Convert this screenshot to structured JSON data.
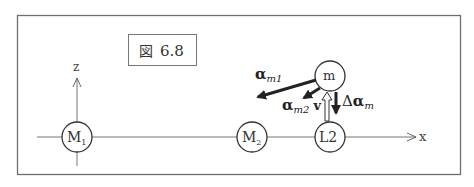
{
  "figure": {
    "caption_prefix": "図",
    "caption_number": "6.8"
  },
  "axes": {
    "z_label": "z",
    "x_label": "x"
  },
  "bodies": {
    "m1": {
      "label": "M",
      "subscript": "1"
    },
    "m2": {
      "label": "M",
      "subscript": "2"
    },
    "l2": {
      "label": "L2"
    },
    "m": {
      "label": "m"
    }
  },
  "vectors": {
    "alpha_m1": {
      "symbol": "α",
      "subscript": "m1"
    },
    "alpha_m2": {
      "symbol": "α",
      "subscript": "m2"
    },
    "v": {
      "symbol": "v"
    },
    "delta_alpha_m": {
      "prefix": "Δ",
      "symbol": "α",
      "subscript": "m"
    }
  },
  "colors": {
    "frame": "#6e6e6e",
    "line": "#777777",
    "ink": "#222222"
  }
}
